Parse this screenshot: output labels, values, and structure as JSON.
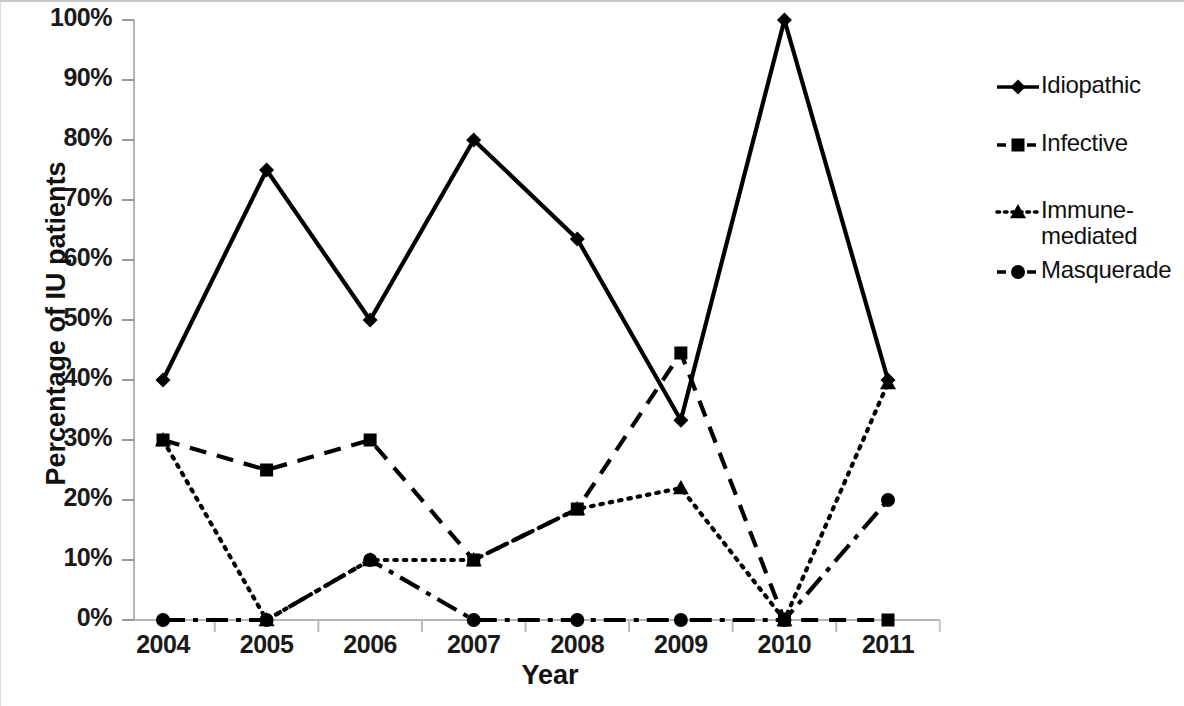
{
  "chart_data": {
    "type": "line",
    "title": "",
    "xlabel": "Year",
    "ylabel": "Percentage of IU patients",
    "categories": [
      "2004",
      "2005",
      "2006",
      "2007",
      "2008",
      "2009",
      "2010",
      "2011"
    ],
    "x": [
      2004,
      2005,
      2006,
      2007,
      2008,
      2009,
      2010,
      2011
    ],
    "ylim": [
      0,
      100
    ],
    "ytick_labels": [
      "0%",
      "10%",
      "20%",
      "30%",
      "40%",
      "50%",
      "60%",
      "70%",
      "80%",
      "90%",
      "100%"
    ],
    "ytick_values": [
      0,
      10,
      20,
      30,
      40,
      50,
      60,
      70,
      80,
      90,
      100
    ],
    "grid": false,
    "legend_position": "right",
    "series": [
      {
        "name": "Idiopathic",
        "marker": "diamond",
        "line_style": "solid",
        "color": "#000000",
        "values": [
          40,
          75,
          50,
          80,
          63.5,
          33.3,
          100,
          40
        ]
      },
      {
        "name": "Infective",
        "marker": "square",
        "line_style": "dashed",
        "color": "#000000",
        "values": [
          30,
          25,
          30,
          10,
          18.5,
          44.5,
          0,
          0
        ]
      },
      {
        "name": "Immune-mediated",
        "marker": "triangle",
        "line_style": "dotted",
        "color": "#000000",
        "values": [
          30,
          0,
          10,
          10,
          18.5,
          22,
          0,
          39.5
        ]
      },
      {
        "name": "Masquerade",
        "marker": "circle",
        "line_style": "dashdot",
        "color": "#000000",
        "values": [
          0,
          0,
          10,
          0,
          0,
          0,
          0,
          20
        ]
      }
    ]
  },
  "legend": {
    "entries": [
      {
        "label": "Idiopathic",
        "key_icon": "diamond-solid-line-icon"
      },
      {
        "label": "Infective",
        "key_icon": "square-dashed-line-icon"
      },
      {
        "label": "Immune-\nmediated",
        "key_icon": "triangle-dotted-line-icon"
      },
      {
        "label": "Masquerade",
        "key_icon": "circle-dashdot-line-icon"
      }
    ]
  },
  "axes": {
    "y_title": "Percentage of IU patients",
    "x_title": "Year"
  }
}
